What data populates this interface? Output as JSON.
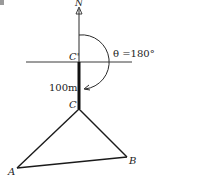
{
  "figure": {
    "north_label": "N",
    "point_c_prime_label": "C'",
    "angle_label": "θ =180°",
    "distance_label": "100m",
    "point_c_label": "C",
    "point_a_label": "A",
    "point_b_label": "B"
  },
  "colors": {
    "line": "#2a2a2a",
    "background": "#ffffff"
  }
}
